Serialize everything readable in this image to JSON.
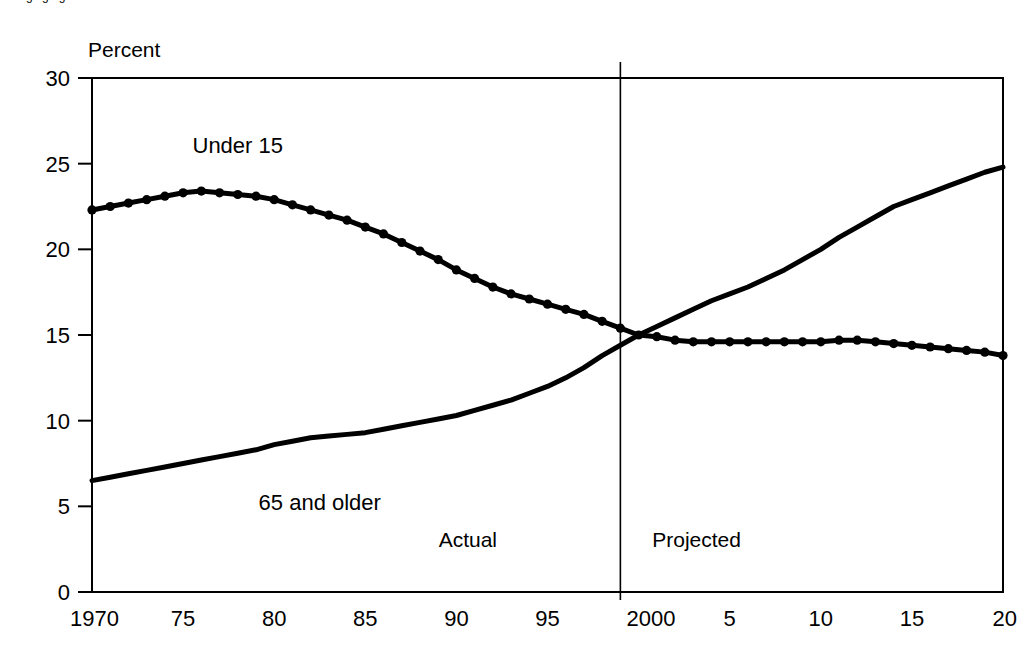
{
  "page": {
    "clipped_heading": "changing age structure",
    "background_color": "#ffffff",
    "ink_color": "#000000"
  },
  "chart_data": {
    "type": "line",
    "title": "",
    "subtitle": "",
    "ylabel": "Percent",
    "xlabel": "",
    "grid": false,
    "legend_position": "inline-annotation",
    "xlim": [
      1970,
      2020
    ],
    "ylim": [
      0,
      30
    ],
    "ytick_values": [
      0,
      5,
      10,
      15,
      20,
      25,
      30
    ],
    "ytick_labels": [
      "0",
      "5",
      "10",
      "15",
      "20",
      "25",
      "30"
    ],
    "xtick_values": [
      1970,
      1975,
      1980,
      1985,
      1990,
      1995,
      2000,
      2005,
      2010,
      2015,
      2020
    ],
    "xtick_labels": [
      "1970",
      "75",
      "80",
      "85",
      "90",
      "95",
      "2000",
      "5",
      "10",
      "15",
      "20"
    ],
    "annotations": [
      {
        "name": "actual-label",
        "text": "Actual",
        "x": 1993.0,
        "y": 2.6
      },
      {
        "name": "projected-label",
        "text": "Projected",
        "x": 2000.2,
        "y": 2.6
      }
    ],
    "reference_line": {
      "name": "actual-projected-divider",
      "x": 1999.0,
      "orientation": "vertical"
    },
    "x": [
      1970,
      1971,
      1972,
      1973,
      1974,
      1975,
      1976,
      1977,
      1978,
      1979,
      1980,
      1981,
      1982,
      1983,
      1984,
      1985,
      1986,
      1987,
      1988,
      1989,
      1990,
      1991,
      1992,
      1993,
      1994,
      1995,
      1996,
      1997,
      1998,
      1999,
      2000,
      2001,
      2002,
      2003,
      2004,
      2005,
      2006,
      2007,
      2008,
      2009,
      2010,
      2011,
      2012,
      2013,
      2014,
      2015,
      2016,
      2017,
      2018,
      2019,
      2020
    ],
    "series": [
      {
        "name": "Under 15",
        "label": "Under 15",
        "label_x": 1978.0,
        "label_y": 25.6,
        "color": "#000000",
        "marker": "circle",
        "values": [
          22.3,
          22.5,
          22.7,
          22.9,
          23.1,
          23.3,
          23.4,
          23.3,
          23.2,
          23.1,
          22.9,
          22.6,
          22.3,
          22.0,
          21.7,
          21.3,
          20.9,
          20.4,
          19.9,
          19.4,
          18.8,
          18.3,
          17.8,
          17.4,
          17.1,
          16.8,
          16.5,
          16.2,
          15.8,
          15.4,
          15.0,
          14.9,
          14.7,
          14.6,
          14.6,
          14.6,
          14.6,
          14.6,
          14.6,
          14.6,
          14.6,
          14.7,
          14.7,
          14.6,
          14.5,
          14.4,
          14.3,
          14.2,
          14.1,
          14.0,
          13.8
        ]
      },
      {
        "name": "65 and older",
        "label": "65 and older",
        "label_x": 1982.5,
        "label_y": 4.8,
        "color": "#000000",
        "marker": "none",
        "values": [
          6.5,
          6.7,
          6.9,
          7.1,
          7.3,
          7.5,
          7.7,
          7.9,
          8.1,
          8.3,
          8.6,
          8.8,
          9.0,
          9.1,
          9.2,
          9.3,
          9.5,
          9.7,
          9.9,
          10.1,
          10.3,
          10.6,
          10.9,
          11.2,
          11.6,
          12.0,
          12.5,
          13.1,
          13.8,
          14.4,
          15.0,
          15.5,
          16.0,
          16.5,
          17.0,
          17.4,
          17.8,
          18.3,
          18.8,
          19.4,
          20.0,
          20.7,
          21.3,
          21.9,
          22.5,
          22.9,
          23.3,
          23.7,
          24.1,
          24.5,
          24.8
        ]
      }
    ]
  }
}
